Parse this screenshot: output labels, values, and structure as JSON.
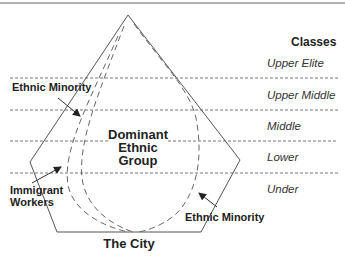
{
  "diagram": {
    "classes_header": "Classes",
    "classes": [
      {
        "label": "Upper Elite"
      },
      {
        "label": "Upper Middle"
      },
      {
        "label": "Middle"
      },
      {
        "label": "Lower"
      },
      {
        "label": "Under"
      }
    ],
    "center_label": {
      "line1": "Dominant",
      "line2": "Ethnic",
      "line3": "Group"
    },
    "labels": {
      "ethnic_minority_top": "Ethnic Minority",
      "immigrant_line1": "Immigrant",
      "immigrant_line2": "Workers",
      "ethnic_minority_bottom": "Ethnic Minority",
      "city": "The City"
    }
  },
  "colors": {
    "line": "#555555",
    "text": "#222222",
    "background": "#ffffff"
  }
}
